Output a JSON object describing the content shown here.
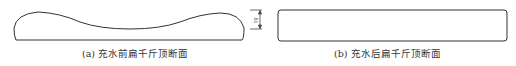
{
  "figure_a": {
    "caption": "(a) 充水前扁千斤顶断面"
  },
  "figure_b": {
    "caption": "(b) 充水后扁千斤顶断面"
  },
  "dimension": {
    "label": "δ1"
  },
  "colors": {
    "stroke": "#333333"
  }
}
